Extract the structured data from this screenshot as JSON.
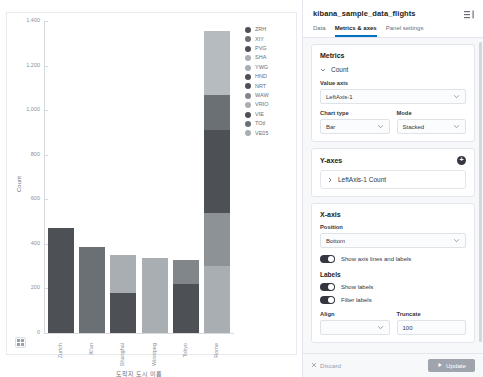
{
  "chart_data": {
    "type": "bar",
    "title": "",
    "xlabel": "도착지 도시 이름",
    "ylabel": "Count",
    "ylim": [
      0,
      1400
    ],
    "yticks": [
      "0",
      "200",
      "400",
      "600",
      "800",
      "1,000",
      "1,200",
      "1,400"
    ],
    "ytick_values": [
      0,
      200,
      400,
      600,
      800,
      1000,
      1200,
      1400
    ],
    "grid": false,
    "stacked": true,
    "legend_position": "right",
    "categories": [
      "Zurich",
      "Xi'an",
      "Shanghai",
      "Winnipeg",
      "Tokyo",
      "Rome"
    ],
    "series": [
      {
        "name": "ZRH",
        "color": "#4d5156",
        "values": [
          470,
          0,
          0,
          0,
          0,
          0
        ]
      },
      {
        "name": "XIY",
        "color": "#6b7075",
        "values": [
          0,
          385,
          0,
          0,
          0,
          0
        ]
      },
      {
        "name": "PVG",
        "color": "#4d5156",
        "values": [
          0,
          0,
          178,
          0,
          0,
          0
        ]
      },
      {
        "name": "SHA",
        "color": "#a9aeb3",
        "values": [
          0,
          0,
          170,
          0,
          0,
          0
        ]
      },
      {
        "name": "YWG",
        "color": "#a9aeb3",
        "values": [
          0,
          0,
          0,
          335,
          0,
          0
        ]
      },
      {
        "name": "HND",
        "color": "#4d5156",
        "values": [
          0,
          0,
          0,
          0,
          218,
          0
        ]
      },
      {
        "name": "NRT",
        "color": "#81868b",
        "values": [
          0,
          0,
          0,
          0,
          110,
          0
        ]
      },
      {
        "name": "WAW",
        "color": "#a9aeb3",
        "values": [
          0,
          0,
          0,
          0,
          0,
          300
        ]
      },
      {
        "name": "VRIO",
        "color": "#8d9297",
        "values": [
          0,
          0,
          0,
          0,
          0,
          238
        ]
      },
      {
        "name": "VIE",
        "color": "#4d5156",
        "values": [
          0,
          0,
          0,
          0,
          0,
          372
        ]
      },
      {
        "name": "TOtl",
        "color": "#6b7075",
        "values": [
          0,
          0,
          0,
          0,
          0,
          156
        ]
      },
      {
        "name": "VE05",
        "color": "#b6bbc0",
        "values": [
          0,
          0,
          0,
          0,
          0,
          290
        ]
      }
    ],
    "bars": [
      {
        "category": "Zurich",
        "segments": [
          {
            "name": "ZRH",
            "value": 470,
            "color": "#4d5156"
          }
        ]
      },
      {
        "category": "Xi'an",
        "segments": [
          {
            "name": "XIY",
            "value": 385,
            "color": "#6b7075"
          }
        ]
      },
      {
        "category": "Shanghai",
        "segments": [
          {
            "name": "PVG",
            "value": 178,
            "color": "#4d5156"
          },
          {
            "name": "SHA",
            "value": 170,
            "color": "#a9aeb3"
          }
        ]
      },
      {
        "category": "Winnipeg",
        "segments": [
          {
            "name": "YWG",
            "value": 335,
            "color": "#a9aeb3"
          }
        ]
      },
      {
        "category": "Tokyo",
        "segments": [
          {
            "name": "HND",
            "value": 218,
            "color": "#4d5156"
          },
          {
            "name": "NRT",
            "value": 110,
            "color": "#81868b"
          }
        ]
      },
      {
        "category": "Rome",
        "segments": [
          {
            "name": "WAW",
            "value": 300,
            "color": "#a9aeb3"
          },
          {
            "name": "VRIO",
            "value": 238,
            "color": "#8d9297"
          },
          {
            "name": "VIE",
            "value": 372,
            "color": "#4d5156"
          },
          {
            "name": "TOtl",
            "value": 156,
            "color": "#6b7075"
          },
          {
            "name": "VE05",
            "value": 290,
            "color": "#b6bbc0"
          }
        ]
      }
    ],
    "legend": [
      {
        "label": "ZRH",
        "color": "#4d5156"
      },
      {
        "label": "XIY",
        "color": "#6b7075"
      },
      {
        "label": "PVG",
        "color": "#4d5156"
      },
      {
        "label": "SHA",
        "color": "#a9aeb3"
      },
      {
        "label": "YWG",
        "color": "#a9aeb3"
      },
      {
        "label": "HND",
        "color": "#4d5156"
      },
      {
        "label": "NRT",
        "color": "#4d5156"
      },
      {
        "label": "WAW",
        "color": "#81868b"
      },
      {
        "label": "VRIO",
        "color": "#a9aeb3"
      },
      {
        "label": "VIE",
        "color": "#4d5156"
      },
      {
        "label": "TOtl",
        "color": "#6b7075"
      },
      {
        "label": "VE05",
        "color": "#a9aeb3"
      }
    ]
  },
  "chart_pane": {
    "corner_icon": "grid-icon"
  },
  "panel": {
    "title": "kibana_sample_data_flights",
    "collapse_icon": "collapse-panel-icon",
    "tabs": [
      {
        "label": "Data",
        "active": false
      },
      {
        "label": "Metrics & axes",
        "active": true
      },
      {
        "label": "Panel settings",
        "active": false
      }
    ],
    "metrics": {
      "title": "Metrics",
      "accordion_label": "Count",
      "value_axis_label": "Value axis",
      "value_axis_value": "LeftAxis-1",
      "chart_type_label": "Chart type",
      "chart_type_value": "Bar",
      "mode_label": "Mode",
      "mode_value": "Stacked"
    },
    "yaxes": {
      "title": "Y-axes",
      "add_label": "+",
      "item_label": "LeftAxis-1 Count"
    },
    "xaxis": {
      "title": "X-axis",
      "position_label": "Position",
      "position_value": "Bottom",
      "show_axis_lines_label": "Show axis lines and labels",
      "labels_title": "Labels",
      "show_labels_label": "Show labels",
      "filter_labels_label": "Filter labels",
      "align_label": "Align",
      "align_value": "",
      "truncate_label": "Truncate",
      "truncate_value": "100"
    },
    "footer": {
      "discard_label": "Discard",
      "discard_icon": "close-icon",
      "update_label": "Update",
      "update_icon": "play-icon"
    }
  }
}
